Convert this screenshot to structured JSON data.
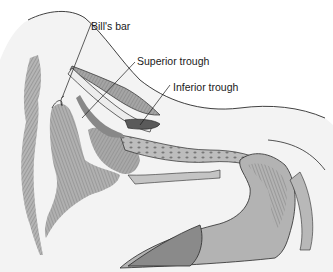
{
  "figure": {
    "labels": [
      {
        "id": "bills-bar",
        "text": "Bill's bar"
      },
      {
        "id": "superior-trough",
        "text": "Superior trough"
      },
      {
        "id": "inferior-trough",
        "text": "Inferior trough"
      }
    ]
  },
  "colors": {
    "background": "#ffffff",
    "tissue_light": "#f1f1f1",
    "tissue_mid": "#b8b8b8",
    "tissue_dark": "#8c8c8c",
    "tissue_darkest": "#6e6e6e",
    "line": "#2a2a2a"
  }
}
